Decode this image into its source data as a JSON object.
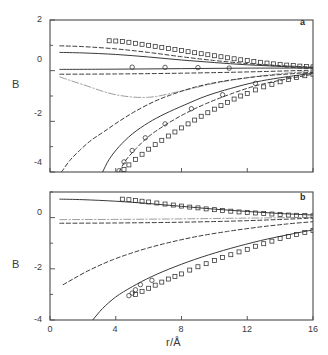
{
  "figure": {
    "axis_label_y": "B",
    "axis_label_x": "r/Å",
    "panels": [
      {
        "id": "a",
        "label": "a"
      },
      {
        "id": "b",
        "label": "b"
      }
    ]
  },
  "chart_data": [
    {
      "type": "line",
      "panel": "a",
      "title": "",
      "xlabel": "r/Å",
      "ylabel": "B",
      "xlim": [
        0,
        16
      ],
      "ylim": [
        -4,
        2
      ],
      "xticks": [
        0,
        4,
        8,
        12,
        16
      ],
      "yticks": [
        -4,
        -2,
        0,
        2
      ],
      "xtick_labels": [
        "0",
        "4",
        "8",
        "12",
        "16"
      ],
      "ytick_labels": [
        "-4",
        "-2",
        "0",
        "2"
      ],
      "grid": false,
      "legend": "none",
      "series": [
        {
          "name": "upper-squares-experimental",
          "style": "open-square-markers",
          "x": [
            3.6,
            4.0,
            4.4,
            4.8,
            5.2,
            5.6,
            6.0,
            6.4,
            6.8,
            7.2,
            7.6,
            8.0,
            8.4,
            8.8,
            9.2,
            9.6,
            10.0,
            10.4,
            10.8,
            11.2,
            11.6,
            12.0,
            12.4,
            12.8,
            13.2,
            13.6,
            14.0,
            14.4,
            14.8,
            15.2,
            15.6,
            16.0
          ],
          "y": [
            1.18,
            1.17,
            1.15,
            1.12,
            1.08,
            1.04,
            1.0,
            0.96,
            0.92,
            0.88,
            0.84,
            0.8,
            0.75,
            0.71,
            0.67,
            0.63,
            0.59,
            0.55,
            0.51,
            0.47,
            0.43,
            0.4,
            0.36,
            0.33,
            0.3,
            0.27,
            0.25,
            0.22,
            0.2,
            0.18,
            0.16,
            0.15
          ]
        },
        {
          "name": "upper-dashed-long",
          "style": "dashed",
          "x": [
            0.6,
            2,
            4,
            6,
            8,
            10,
            12,
            14,
            16
          ],
          "y": [
            0.98,
            0.95,
            0.86,
            0.72,
            0.55,
            0.4,
            0.28,
            0.2,
            0.14
          ]
        },
        {
          "name": "upper-solid",
          "style": "solid",
          "x": [
            0.6,
            2,
            4,
            6,
            8,
            10,
            12,
            14,
            16
          ],
          "y": [
            0.72,
            0.7,
            0.64,
            0.54,
            0.42,
            0.32,
            0.23,
            0.17,
            0.12
          ]
        },
        {
          "name": "near-zero-solid",
          "style": "solid",
          "x": [
            0.6,
            4,
            8,
            12,
            16
          ],
          "y": [
            0.05,
            0.06,
            0.08,
            0.1,
            0.1
          ]
        },
        {
          "name": "near-zero-dashed",
          "style": "dashed",
          "x": [
            0.6,
            4,
            8,
            12,
            16
          ],
          "y": [
            -0.14,
            -0.13,
            -0.1,
            -0.05,
            0.02
          ]
        },
        {
          "name": "isolated-circles",
          "style": "open-circle-markers",
          "x": [
            5.0,
            7.0,
            9.0,
            10.9
          ],
          "y": [
            0.14,
            0.13,
            0.12,
            0.1
          ]
        },
        {
          "name": "lower-dashdot-light",
          "style": "dash-dot-light",
          "x": [
            0.6,
            2,
            4,
            6,
            8,
            10,
            12,
            14,
            16
          ],
          "y": [
            -0.25,
            -0.55,
            -0.95,
            -1.05,
            -0.8,
            -0.5,
            -0.28,
            -0.12,
            -0.02
          ]
        },
        {
          "name": "rising-dashed-left",
          "style": "dashed",
          "x": [
            0.7,
            1.2,
            1.8,
            2.5,
            3.3,
            4.2,
            5.2,
            6.4,
            7.6,
            9.0,
            10.5,
            12.0,
            13.5,
            16.0
          ],
          "y": [
            -4.0,
            -3.55,
            -3.15,
            -2.75,
            -2.4,
            -2.0,
            -1.6,
            -1.2,
            -0.9,
            -0.62,
            -0.42,
            -0.28,
            -0.18,
            -0.06
          ]
        },
        {
          "name": "rising-solid-mid",
          "style": "solid",
          "x": [
            3.2,
            3.6,
            4.2,
            5.0,
            6.0,
            7.0,
            8.2,
            9.5,
            11.0,
            12.5,
            14.0,
            16.0
          ],
          "y": [
            -4.0,
            -3.5,
            -3.0,
            -2.5,
            -2.05,
            -1.7,
            -1.35,
            -1.0,
            -0.7,
            -0.45,
            -0.28,
            -0.1
          ]
        },
        {
          "name": "rising-dashed-right",
          "style": "dashed",
          "x": [
            4.2,
            4.6,
            5.2,
            6.0,
            7.0,
            8.2,
            9.5,
            11.0,
            12.5,
            14.0,
            16.0
          ],
          "y": [
            -4.0,
            -3.55,
            -3.1,
            -2.6,
            -2.15,
            -1.7,
            -1.3,
            -0.92,
            -0.6,
            -0.38,
            -0.14
          ]
        },
        {
          "name": "lower-squares-experimental",
          "style": "open-square-markers",
          "x": [
            4.5,
            4.8,
            5.2,
            5.6,
            6.0,
            6.4,
            6.8,
            7.2,
            7.6,
            8.0,
            8.4,
            8.8,
            9.2,
            9.6,
            10.0,
            10.4,
            10.8,
            11.2,
            11.6,
            12.0,
            12.5,
            13.0,
            13.5,
            14.0,
            14.5,
            15.0,
            15.5,
            16.0
          ],
          "y": [
            -3.9,
            -3.72,
            -3.5,
            -3.3,
            -3.1,
            -2.92,
            -2.75,
            -2.58,
            -2.42,
            -2.26,
            -2.1,
            -1.95,
            -1.8,
            -1.66,
            -1.52,
            -1.38,
            -1.25,
            -1.12,
            -1.0,
            -0.9,
            -0.76,
            -0.64,
            -0.54,
            -0.44,
            -0.35,
            -0.27,
            -0.2,
            -0.14
          ]
        },
        {
          "name": "lower-circles-experimental",
          "style": "open-circle-markers",
          "x": [
            4.2,
            4.5,
            5.0,
            5.8,
            7.0,
            8.6,
            10.5,
            12.5
          ],
          "y": [
            -3.95,
            -3.6,
            -3.15,
            -2.65,
            -2.1,
            -1.5,
            -0.95,
            -0.5
          ]
        }
      ]
    },
    {
      "type": "line",
      "panel": "b",
      "title": "",
      "xlabel": "r/Å",
      "ylabel": "B",
      "xlim": [
        0,
        16
      ],
      "ylim": [
        -4,
        1
      ],
      "xticks": [
        0,
        4,
        8,
        12,
        16
      ],
      "yticks": [
        -4,
        -2,
        0
      ],
      "xtick_labels": [
        "0",
        "4",
        "8",
        "12",
        "16"
      ],
      "ytick_labels": [
        "-4",
        "-2",
        "0"
      ],
      "grid": false,
      "legend": "none",
      "series": [
        {
          "name": "top-solid-descending",
          "style": "solid",
          "x": [
            0.6,
            2,
            4,
            6,
            8,
            10,
            12,
            14,
            16
          ],
          "y": [
            0.72,
            0.7,
            0.64,
            0.55,
            0.44,
            0.33,
            0.24,
            0.16,
            0.1
          ]
        },
        {
          "name": "top-squares-experimental",
          "style": "open-square-markers",
          "x": [
            4.4,
            4.8,
            5.2,
            5.6,
            6.0,
            6.5,
            7.0,
            7.5,
            8.0,
            8.5,
            9.0,
            9.5,
            10.0,
            10.5,
            11.0,
            11.5,
            12.0,
            12.5,
            13.0,
            13.5,
            14.0,
            14.5,
            15.0,
            15.5,
            16.0
          ],
          "y": [
            0.72,
            0.7,
            0.67,
            0.64,
            0.61,
            0.57,
            0.53,
            0.49,
            0.45,
            0.41,
            0.38,
            0.34,
            0.31,
            0.28,
            0.25,
            0.22,
            0.2,
            0.18,
            0.16,
            0.14,
            0.12,
            0.1,
            0.09,
            0.08,
            0.07
          ]
        },
        {
          "name": "near-zero-dashdot-light",
          "style": "dash-dot-light",
          "x": [
            0.6,
            4,
            8,
            12,
            16
          ],
          "y": [
            -0.08,
            -0.07,
            -0.05,
            -0.02,
            0.01
          ]
        },
        {
          "name": "near-zero-dashed",
          "style": "dashed",
          "x": [
            0.6,
            4,
            8,
            12,
            16
          ],
          "y": [
            -0.22,
            -0.21,
            -0.18,
            -0.12,
            -0.02
          ]
        },
        {
          "name": "rising-dashed-b",
          "style": "dashed",
          "x": [
            0.8,
            1.4,
            2.1,
            2.9,
            3.8,
            4.8,
            6.0,
            7.4,
            9.0,
            10.8,
            12.6,
            14.4,
            16.0
          ],
          "y": [
            -2.62,
            -2.4,
            -2.15,
            -1.9,
            -1.65,
            -1.42,
            -1.18,
            -0.95,
            -0.73,
            -0.54,
            -0.38,
            -0.25,
            -0.16
          ]
        },
        {
          "name": "rising-solid-b",
          "style": "solid",
          "x": [
            2.6,
            3.2,
            4.0,
            5.0,
            6.2,
            7.6,
            9.2,
            11.0,
            12.8,
            14.4,
            16.0
          ],
          "y": [
            -4.0,
            -3.55,
            -3.1,
            -2.7,
            -2.3,
            -1.92,
            -1.55,
            -1.2,
            -0.9,
            -0.68,
            -0.48
          ]
        },
        {
          "name": "lower-squares-b",
          "style": "open-square-markers",
          "x": [
            5.2,
            5.6,
            6.0,
            6.4,
            6.8,
            7.2,
            7.6,
            8.0,
            8.5,
            9.0,
            9.5,
            10.0,
            10.5,
            11.0,
            11.5,
            12.0,
            12.5,
            13.0,
            13.5,
            14.0,
            14.5,
            15.0,
            15.5,
            16.0
          ],
          "y": [
            -3.0,
            -2.88,
            -2.76,
            -2.64,
            -2.52,
            -2.4,
            -2.3,
            -2.2,
            -2.05,
            -1.92,
            -1.8,
            -1.68,
            -1.56,
            -1.45,
            -1.34,
            -1.24,
            -1.12,
            -1.02,
            -0.92,
            -0.82,
            -0.74,
            -0.66,
            -0.58,
            -0.5
          ]
        },
        {
          "name": "lower-circles-b",
          "style": "open-circle-markers",
          "x": [
            4.8,
            5.0,
            5.2,
            5.5,
            6.2
          ],
          "y": [
            -3.05,
            -2.95,
            -2.82,
            -2.62,
            -2.45
          ]
        }
      ]
    }
  ]
}
